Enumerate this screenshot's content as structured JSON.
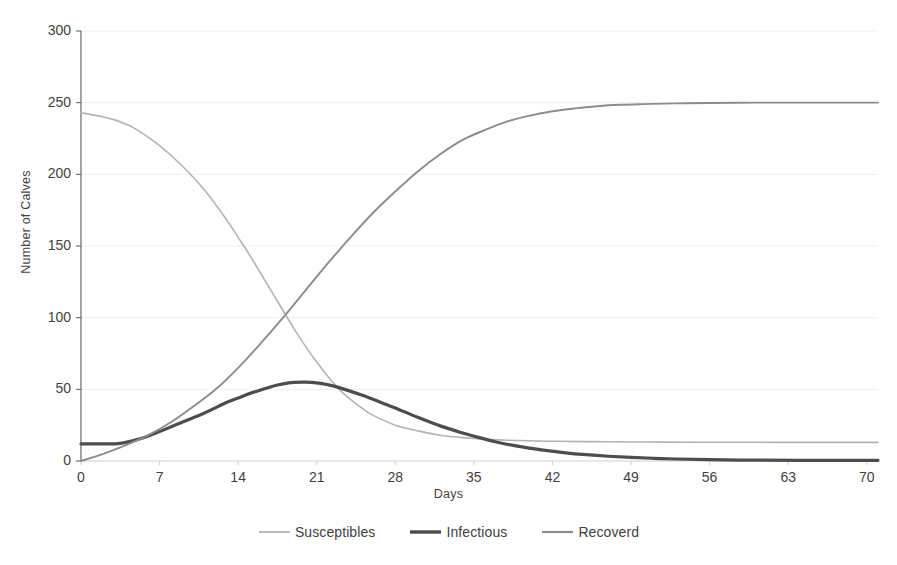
{
  "chart_data": {
    "type": "line",
    "title": "",
    "xlabel": "Days",
    "ylabel": "Number of Calves",
    "xlim": [
      0,
      71
    ],
    "ylim": [
      0,
      300
    ],
    "xticks": [
      0,
      7,
      14,
      21,
      28,
      35,
      42,
      49,
      56,
      63,
      70
    ],
    "yticks": [
      0,
      50,
      100,
      150,
      200,
      250,
      300
    ],
    "grid": true,
    "grid_axis": "y",
    "legend_position": "bottom",
    "series": [
      {
        "name": "Susceptibles",
        "color": "#b3b3b3",
        "width": 1.6,
        "x": [
          0,
          2,
          3,
          4,
          5,
          7,
          9,
          11,
          13,
          14,
          15,
          16,
          17,
          18,
          19,
          20,
          21,
          22,
          23,
          24,
          25,
          26,
          28,
          30,
          32,
          34,
          35,
          36,
          38,
          40,
          42,
          45,
          49,
          52,
          56,
          60,
          63,
          67,
          71
        ],
        "y": [
          243,
          240,
          238,
          235,
          231,
          220,
          206,
          189,
          168,
          156,
          144,
          131,
          118,
          105,
          92,
          80,
          69,
          59,
          50,
          43,
          37,
          32,
          25,
          21,
          18,
          16.3,
          15.7,
          15.2,
          14.5,
          14.1,
          13.8,
          13.5,
          13.3,
          13.2,
          13.1,
          13.05,
          13.0,
          13.0,
          13.0
        ]
      },
      {
        "name": "Infectious",
        "color": "#4d4d4d",
        "width": 3.2,
        "x": [
          0,
          1,
          2,
          3,
          4,
          5,
          6,
          7,
          9,
          11,
          13,
          14,
          15,
          16,
          17,
          18,
          19,
          20,
          21,
          22,
          23,
          25,
          27,
          28,
          30,
          32,
          34,
          35,
          37,
          39,
          41,
          43,
          45,
          47,
          49,
          51,
          53,
          56,
          60,
          64,
          68,
          71
        ],
        "y": [
          12,
          12,
          12,
          12,
          13,
          15,
          17.5,
          20.5,
          27,
          33.5,
          41,
          44,
          47,
          49.5,
          52,
          53.8,
          54.8,
          55,
          54.5,
          53.2,
          51.2,
          46,
          40,
          37,
          30.5,
          24.5,
          19.5,
          17.3,
          13.3,
          10.2,
          7.8,
          5.9,
          4.4,
          3.3,
          2.5,
          1.9,
          1.4,
          0.9,
          0.6,
          0.5,
          0.5,
          0.5
        ]
      },
      {
        "name": "Recoverd",
        "color": "#8c8c8c",
        "width": 1.9,
        "x": [
          0,
          2,
          4,
          6,
          8,
          10,
          12,
          14,
          16,
          18,
          20,
          22,
          24,
          26,
          28,
          30,
          32,
          34,
          36,
          38,
          40,
          42,
          44,
          46,
          48,
          50,
          53,
          56,
          60,
          64,
          68,
          71
        ],
        "y": [
          0,
          5,
          11,
          18,
          27,
          38,
          50,
          65,
          82,
          100,
          119,
          138,
          156,
          173,
          188,
          202,
          214,
          224,
          231,
          237,
          241,
          244,
          246,
          247.5,
          248.5,
          249,
          249.5,
          249.8,
          250,
          250,
          250,
          250
        ]
      }
    ]
  },
  "axes": {
    "y_title": "Number of Calves",
    "x_title": "Days",
    "y_tick_labels": [
      "300",
      "250",
      "200",
      "150",
      "100",
      "50",
      "0"
    ],
    "x_tick_labels": [
      "0",
      "7",
      "14",
      "21",
      "28",
      "35",
      "42",
      "49",
      "56",
      "63",
      "70"
    ]
  },
  "legend": {
    "items": [
      {
        "label": "Susceptibles",
        "color": "#b3b3b3",
        "width": 1.8
      },
      {
        "label": "Infectious",
        "color": "#4d4d4d",
        "width": 3.4
      },
      {
        "label": "Recoverd",
        "color": "#8c8c8c",
        "width": 2.2
      }
    ]
  },
  "colors": {
    "susceptibles": "#b3b3b3",
    "infectious": "#4d4d4d",
    "recovered": "#8c8c8c",
    "axis": "#585858",
    "grid": "#efefef",
    "text": "#3f3f3f",
    "background": "#ffffff"
  }
}
